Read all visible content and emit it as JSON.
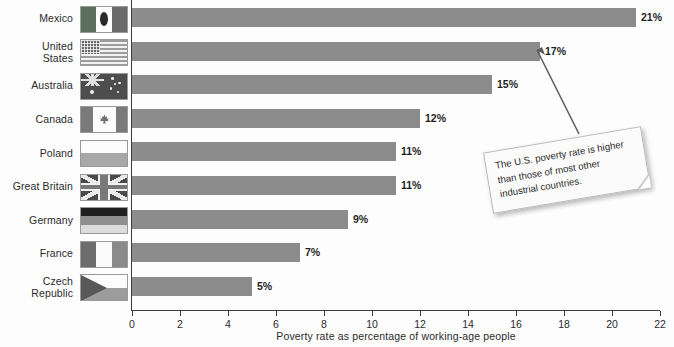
{
  "chart_data": {
    "type": "bar",
    "orientation": "horizontal",
    "title": "",
    "xlabel": "Poverty rate as percentage of working-age people",
    "ylabel": "",
    "xlim": [
      0,
      22
    ],
    "xticks": [
      0,
      2,
      4,
      6,
      8,
      10,
      12,
      14,
      16,
      18,
      20,
      22
    ],
    "grid": false,
    "legend": false,
    "categories": [
      "Mexico",
      "United States",
      "Australia",
      "Canada",
      "Poland",
      "Great Britain",
      "Germany",
      "France",
      "Czech Republic"
    ],
    "values": [
      21,
      17,
      15,
      12,
      11,
      11,
      9,
      7,
      5
    ],
    "value_labels": [
      "21%",
      "17%",
      "15%",
      "12%",
      "11%",
      "11%",
      "9%",
      "7%",
      "5%"
    ],
    "bar_color": "#8c8c8c",
    "annotations": [
      {
        "text": "The U.S. poverty rate is higher than those of most other industrial countries.",
        "points_to_category": "United States"
      }
    ]
  },
  "rows": [
    {
      "label": "Mexico",
      "label_lines": "Mexico",
      "value": 21,
      "value_label": "21%",
      "flag": "flag-mexico"
    },
    {
      "label": "United States",
      "label_lines": "United\nStates",
      "value": 17,
      "value_label": "17%",
      "flag": "flag-united-states"
    },
    {
      "label": "Australia",
      "label_lines": "Australia",
      "value": 15,
      "value_label": "15%",
      "flag": "flag-australia"
    },
    {
      "label": "Canada",
      "label_lines": "Canada",
      "value": 12,
      "value_label": "12%",
      "flag": "flag-canada"
    },
    {
      "label": "Poland",
      "label_lines": "Poland",
      "value": 11,
      "value_label": "11%",
      "flag": "flag-poland"
    },
    {
      "label": "Great Britain",
      "label_lines": "Great Britain",
      "value": 11,
      "value_label": "11%",
      "flag": "flag-great-britain"
    },
    {
      "label": "Germany",
      "label_lines": "Germany",
      "value": 9,
      "value_label": "9%",
      "flag": "flag-germany"
    },
    {
      "label": "France",
      "label_lines": "France",
      "value": 7,
      "value_label": "7%",
      "flag": "flag-france"
    },
    {
      "label": "Czech Republic",
      "label_lines": "Czech Republic",
      "value": 5,
      "value_label": "5%",
      "flag": "flag-czech-republic"
    }
  ],
  "axis": {
    "title": "Poverty rate as percentage of working-age people",
    "ticks": [
      "0",
      "2",
      "4",
      "6",
      "8",
      "10",
      "12",
      "14",
      "16",
      "18",
      "20",
      "22"
    ]
  },
  "callout": {
    "text": "The U.S. poverty rate is higher than those of most other industrial countries."
  }
}
